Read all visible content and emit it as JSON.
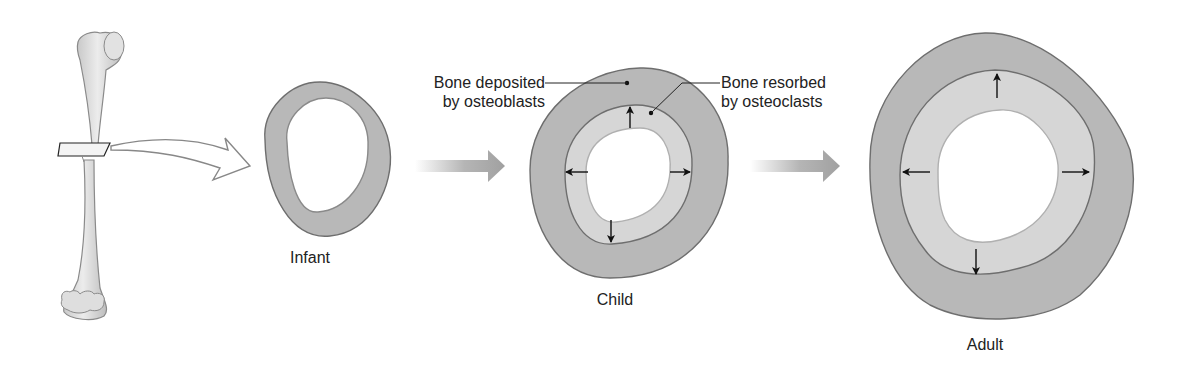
{
  "figure": {
    "stages": [
      {
        "id": "infant",
        "label": "Infant"
      },
      {
        "id": "child",
        "label": "Child"
      },
      {
        "id": "adult",
        "label": "Adult"
      }
    ],
    "annotations": {
      "deposited": {
        "line1": "Bone deposited",
        "line2": "by osteoblasts"
      },
      "resorbed": {
        "line1": "Bone resorbed",
        "line2": "by osteoclasts"
      }
    },
    "colors": {
      "compact_bone": "#b8b8b8",
      "new_bone_inner": "#d6d6d6",
      "outline": "#6e6e6e",
      "bone_shaft": "#dcdcdc",
      "flow_arrow": "#a8a8a8",
      "text": "#222222"
    }
  }
}
